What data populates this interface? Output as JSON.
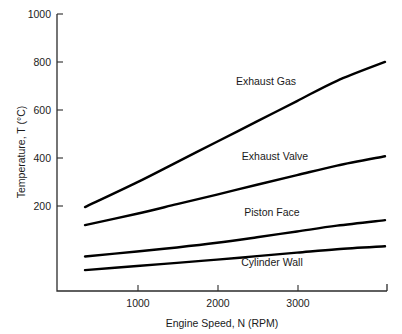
{
  "chart_data": {
    "type": "line",
    "title": "",
    "xlabel": "Engine Speed, N (RPM)",
    "ylabel": "Temperature, T (°C)",
    "xlim": [
      0,
      4125
    ],
    "ylim": [
      46,
      1000
    ],
    "grid": false,
    "legend_position": "inline-curve-labels",
    "xticks": [
      1000,
      2000,
      3000
    ],
    "xtick_labels": [
      "1000",
      "2000",
      "3000"
    ],
    "yticks": [
      200,
      400,
      600,
      800,
      1000
    ],
    "ytick_labels": [
      "200",
      "400",
      "600",
      "800",
      "1000"
    ],
    "x": [
      350,
      1000,
      1500,
      2000,
      2500,
      3000,
      3500,
      4100
    ],
    "series": [
      {
        "name": "Exhaust Gas",
        "label": "Exhaust Gas",
        "color": "#000000",
        "values": [
          335,
          420,
          490,
          560,
          630,
          700,
          770,
          835
        ]
      },
      {
        "name": "Exhaust Valve",
        "label": "Exhaust Valve",
        "color": "#000000",
        "values": [
          273,
          312,
          345,
          378,
          412,
          445,
          478,
          510
        ]
      },
      {
        "name": "Piston Face",
        "label": "Piston Face",
        "color": "#000000",
        "values": [
          165,
          182,
          196,
          212,
          231,
          251,
          271,
          290
        ]
      },
      {
        "name": "Cylinder Wall",
        "label": "Cylinder Wall",
        "color": "#000000",
        "values": [
          118,
          132,
          143,
          154,
          166,
          178,
          190,
          200
        ]
      }
    ]
  },
  "axes": {
    "y_title": "Temperature, T (°C)",
    "x_title": "Engine Speed, N (RPM)"
  },
  "labels": {
    "exhaust_gas": "Exhaust Gas",
    "exhaust_valve": "Exhaust Valve",
    "piston_face": "Piston Face",
    "cylinder_wall": "Cylinder Wall"
  },
  "ticks": {
    "y": [
      "1000",
      "800",
      "600",
      "400",
      "200"
    ],
    "x": [
      "1000",
      "2000",
      "3000"
    ]
  }
}
